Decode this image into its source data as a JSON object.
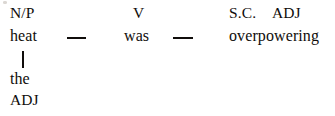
{
  "diagram": {
    "type": "sentence-constituent-diagram",
    "sentence": "the heat was overpowering",
    "rows": {
      "function_labels": {
        "subject": "N/P",
        "verb": "V",
        "complement_marker": "S.C.",
        "complement_class": "ADJ"
      },
      "words": {
        "subject": "heat",
        "verb": "was",
        "complement": "overpowering"
      },
      "modifier": {
        "word": "the",
        "label": "ADJ"
      }
    },
    "connectors": {
      "dash_1": "—",
      "dash_2": "—",
      "branch": "|"
    },
    "colors": {
      "ink": "#100d0b",
      "page": "#ffffff"
    }
  }
}
